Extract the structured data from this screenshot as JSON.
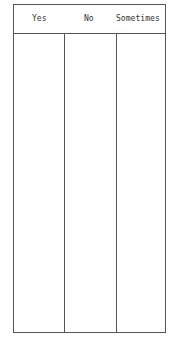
{
  "table": {
    "columns": [
      {
        "label": "Yes"
      },
      {
        "label": "No"
      },
      {
        "label": "Sometimes"
      }
    ],
    "rows": []
  }
}
